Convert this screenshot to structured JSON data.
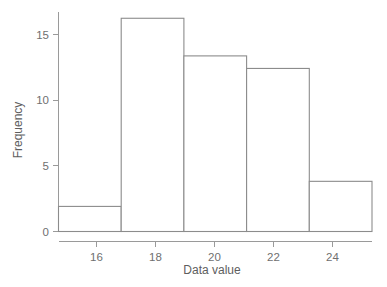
{
  "chart_data": {
    "type": "bar",
    "title": "",
    "subtitle": "",
    "xlabel": "Data value",
    "ylabel": "Frequency",
    "xlim": [
      15,
      25
    ],
    "ylim": [
      0,
      17.5
    ],
    "grid": false,
    "legend": null,
    "bin_width": 2,
    "bin_edges": [
      15,
      17,
      19,
      21,
      23,
      25
    ],
    "categories": [
      "15-17",
      "17-19",
      "19-21",
      "21-23",
      "23-25"
    ],
    "values": [
      2,
      17,
      14,
      13,
      4
    ],
    "bars": [
      {
        "left": 15,
        "right": 17,
        "frequency": 2
      },
      {
        "left": 17,
        "right": 19,
        "frequency": 17
      },
      {
        "left": 19,
        "right": 21,
        "frequency": 14
      },
      {
        "left": 21,
        "right": 23,
        "frequency": 13
      },
      {
        "left": 23,
        "right": 25,
        "frequency": 4
      }
    ],
    "x_ticks": [
      16,
      18,
      20,
      22,
      24
    ],
    "x_tick_labels": [
      "16",
      "18",
      "20",
      "22",
      "24"
    ],
    "y_ticks": [
      0,
      5,
      10,
      15
    ],
    "y_tick_labels": [
      "0",
      "5",
      "10",
      "15"
    ],
    "colors": {
      "bar_fill": "#ffffff",
      "bar_stroke": "#8c8c8c",
      "axis": "#9a9a9a",
      "tick_text": "#6f6f6f",
      "title_text": "#5e5e5e",
      "background": "#ffffff"
    }
  }
}
